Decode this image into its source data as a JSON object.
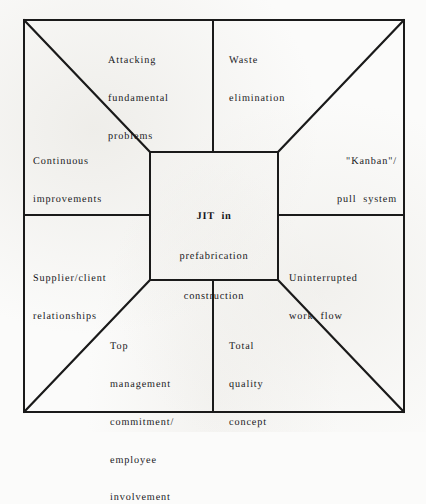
{
  "diagram": {
    "title": "JIT in prefabrication construction",
    "type": "concept-diagram",
    "shape": "square with central box and four corner diagonals",
    "center": {
      "name": "jit-center",
      "lines": [
        "JIT  in",
        "prefabrication",
        "construction"
      ]
    },
    "elements": [
      {
        "name": "attacking-fundamental-problems",
        "position": "top-left",
        "lines": [
          "Attacking",
          "fundamental",
          "problems"
        ]
      },
      {
        "name": "waste-elimination",
        "position": "top-right",
        "lines": [
          "Waste",
          "elimination"
        ]
      },
      {
        "name": "continuous-improvements",
        "position": "left-upper",
        "lines": [
          "Continuous",
          "improvements"
        ]
      },
      {
        "name": "kanban-pull-system",
        "position": "right-upper",
        "lines": [
          "\"Kanban\"/",
          "pull  system"
        ]
      },
      {
        "name": "supplier-client-relationships",
        "position": "left-lower",
        "lines": [
          "Supplier/client",
          "relationships"
        ]
      },
      {
        "name": "uninterrupted-work-flow",
        "position": "right-lower",
        "lines": [
          "Uninterrupted",
          "work  flow"
        ]
      },
      {
        "name": "top-management-commitment",
        "position": "bottom-left",
        "lines": [
          "Top",
          "management",
          "commitment/",
          "employee",
          "involvement"
        ]
      },
      {
        "name": "total-quality-concept",
        "position": "bottom-right",
        "lines": [
          "Total",
          "quality",
          "concept"
        ]
      }
    ],
    "colors": {
      "ink": "#16161a",
      "paper": "#fbfbfa",
      "stroke": "#1a1a1a"
    }
  }
}
